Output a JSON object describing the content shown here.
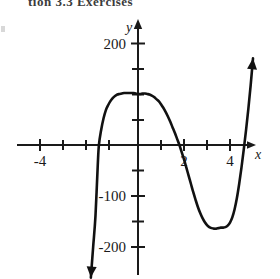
{
  "figure": {
    "title_fragment": "tion 3.3 Exercises",
    "axis_labels": {
      "x": "x",
      "y": "y"
    },
    "colors": {
      "curve": "#111111",
      "axis": "#1a1a1a",
      "background": "#ffffff"
    }
  },
  "chart_data": {
    "type": "line",
    "title": "",
    "xlabel": "x",
    "ylabel": "y",
    "xlim": [
      -5.6,
      5.0
    ],
    "ylim": [
      -240,
      225
    ],
    "grid": false,
    "legend": null,
    "xticks": [
      -5,
      -4,
      -3,
      -2,
      -1,
      0,
      1,
      2,
      3,
      4,
      5
    ],
    "xtick_labels": [
      "",
      "-4",
      "",
      "",
      "",
      "",
      "",
      "2",
      "",
      "4",
      ""
    ],
    "yticks": [
      -200,
      -150,
      -100,
      -50,
      0,
      50,
      100,
      150,
      200
    ],
    "ytick_labels": [
      "-200",
      "",
      "-100",
      "",
      "",
      "",
      "",
      "",
      "200"
    ],
    "annotations": [
      "x-intercept near x = -1.7",
      "local maximum near (0.2, 100)",
      "x-intercept near x = 2.4",
      "local minimum near (3.7, -163)",
      "curve rises steeply past x = 4.9",
      "left branch falls to below -240"
    ],
    "series": [
      {
        "name": "polynomial",
        "x": [
          -2.05,
          -1.95,
          -1.85,
          -1.75,
          -1.7,
          -1.6,
          -1.5,
          -1.4,
          -1.3,
          -1.2,
          -1.1,
          -1.0,
          -0.9,
          -0.8,
          -0.7,
          -0.6,
          -0.5,
          -0.4,
          -0.3,
          -0.2,
          -0.1,
          0.0,
          0.1,
          0.2,
          0.3,
          0.4,
          0.5,
          0.6,
          0.7,
          0.8,
          0.9,
          1.0,
          1.1,
          1.2,
          1.3,
          1.4,
          1.5,
          1.6,
          1.7,
          1.8,
          1.9,
          2.0,
          2.1,
          2.2,
          2.3,
          2.4,
          2.5,
          2.6,
          2.7,
          2.8,
          2.9,
          3.0,
          3.1,
          3.2,
          3.3,
          3.4,
          3.5,
          3.6,
          3.7,
          3.8,
          3.9,
          4.0,
          4.1,
          4.2,
          4.3,
          4.4,
          4.5,
          4.6,
          4.7,
          4.8,
          4.9,
          5.0
        ],
        "y": [
          -260,
          -200,
          -140,
          -40,
          0,
          30,
          52,
          68,
          78,
          86,
          92,
          96,
          99,
          100,
          101,
          102,
          102,
          102,
          102,
          102,
          101,
          100,
          100,
          101,
          101,
          100,
          99,
          97,
          94,
          90,
          86,
          80,
          73,
          65,
          56,
          46,
          35,
          24,
          12,
          0,
          -14,
          -28,
          -44,
          -60,
          -76,
          -92,
          -107,
          -121,
          -133,
          -143,
          -151,
          -157,
          -161,
          -163,
          -164,
          -164,
          -163,
          -162,
          -162,
          -161,
          -158,
          -152,
          -142,
          -126,
          -104,
          -76,
          -44,
          -8,
          30,
          72,
          118,
          170
        ]
      }
    ]
  }
}
